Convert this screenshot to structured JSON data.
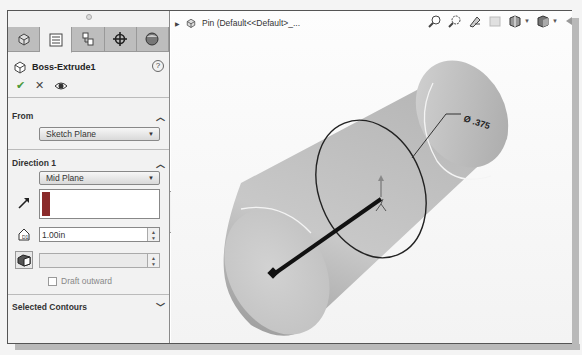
{
  "panel": {
    "tabs": [
      {
        "name": "feature-manager",
        "icon": "part-icon"
      },
      {
        "name": "property-manager",
        "icon": "property-list-icon",
        "active": true
      },
      {
        "name": "configuration-manager",
        "icon": "configuration-icon"
      },
      {
        "name": "dimxpert-manager",
        "icon": "crosshair-icon"
      },
      {
        "name": "display-manager",
        "icon": "appearance-sphere-icon"
      }
    ],
    "feature_name": "Boss-Extrude1",
    "help_label": "?",
    "actions": {
      "ok": "✔",
      "cancel": "✕",
      "preview": "👁"
    },
    "from": {
      "header": "From",
      "value": "Sketch Plane"
    },
    "direction1": {
      "header": "Direction 1",
      "end_condition": "Mid Plane",
      "depth": "1.00in",
      "draft_value": "",
      "draft_outward_label": "Draft outward",
      "draft_outward_checked": false
    },
    "selected_contours": {
      "header": "Selected Contours"
    }
  },
  "viewport": {
    "tree_label": "Pin  (Default<<Default>_...",
    "dimension_label": "Ø .375",
    "hud_icons": [
      "zoom-to-fit-icon",
      "zoom-to-area-icon",
      "previous-view-icon",
      "section-view-icon",
      "view-orientation-icon",
      "display-style-icon"
    ]
  }
}
